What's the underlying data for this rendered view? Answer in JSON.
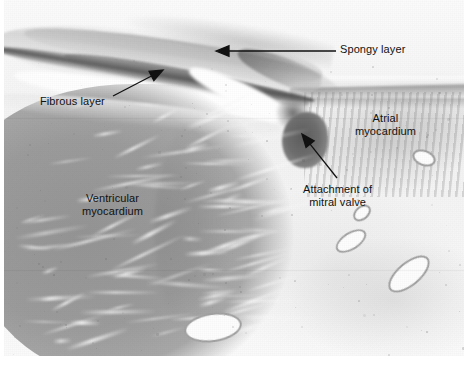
{
  "figure": {
    "kind": "histology-micrograph",
    "stain_tone": "grayscale",
    "width": 472,
    "height": 369
  },
  "annotations": [
    {
      "id": "spongy-layer",
      "label": "Spongy layer",
      "label_x": 340,
      "label_y": 43,
      "arrow": {
        "from_x": 336,
        "from_y": 51,
        "to_x": 216,
        "to_y": 51,
        "head": "left"
      }
    },
    {
      "id": "fibrous-layer",
      "label": "Fibrous layer",
      "label_x": 40,
      "label_y": 95,
      "arrow": {
        "from_x": 113,
        "from_y": 96,
        "to_x": 163,
        "to_y": 70,
        "head": "up-right"
      }
    },
    {
      "id": "atrial-myocardium",
      "label": "Atrial\nmyocardium",
      "label_x": 355,
      "label_y": 112,
      "arrow": null
    },
    {
      "id": "ventricular-myocardium",
      "label": "Ventricular\nmyocardium",
      "label_x": 82,
      "label_y": 192,
      "arrow": null
    },
    {
      "id": "attachment-of-mitral-valve",
      "label": "Attachment of\nmitral valve",
      "label_x": 303,
      "label_y": 183,
      "arrow": {
        "from_x": 337,
        "from_y": 178,
        "to_x": 302,
        "to_y": 134,
        "head": "up-left"
      }
    }
  ],
  "colors": {
    "background": "#ffffff",
    "ventricular_myocardium": "#9a9a9a",
    "atrial_myocardium": "#c9c9c9",
    "nodule_dark": "#656565",
    "fibrous_band": "#4a4a4a",
    "annotation_ink": "#111111"
  }
}
